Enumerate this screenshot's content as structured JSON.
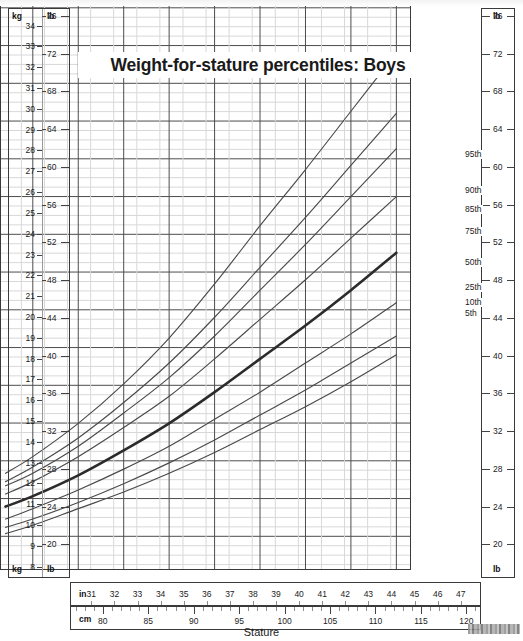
{
  "chart_data": {
    "type": "line",
    "title": "Weight-for-stature percentiles: Boys",
    "xlabel": "Stature",
    "ylabel": "",
    "x_units": [
      "in",
      "cm"
    ],
    "y_units": [
      "kg",
      "lb"
    ],
    "xlim_cm": [
      76.5,
      121.5
    ],
    "ylim_kg": [
      7.5,
      34.8
    ],
    "grid": true,
    "legend_position": "right-inline-curve-labels",
    "x_ticks_cm": [
      80,
      85,
      90,
      95,
      100,
      105,
      110,
      115,
      120
    ],
    "x_ticks_in": [
      31,
      32,
      33,
      34,
      35,
      36,
      37,
      38,
      39,
      40,
      41,
      42,
      43,
      44,
      45,
      46,
      47
    ],
    "y_ticks_kg": [
      8,
      9,
      10,
      11,
      12,
      13,
      14,
      15,
      16,
      17,
      18,
      19,
      20,
      21,
      22,
      23,
      24,
      25,
      26,
      27,
      28,
      29,
      30,
      31,
      32,
      33,
      34
    ],
    "y_ticks_lb": [
      20,
      24,
      28,
      32,
      36,
      40,
      44,
      48,
      52,
      56,
      60,
      64,
      68,
      72,
      76
    ],
    "x_cm": [
      77,
      80,
      85,
      90,
      95,
      100,
      105,
      110,
      115,
      120
    ],
    "series": [
      {
        "name": "95th",
        "label": "95th",
        "values_kg": [
          12.1,
          12.9,
          14.5,
          16.4,
          18.6,
          21.2,
          24.0,
          26.7,
          29.5,
          32.3
        ]
      },
      {
        "name": "90th",
        "label": "90th",
        "values_kg": [
          11.7,
          12.4,
          13.8,
          15.5,
          17.4,
          19.6,
          22.0,
          24.4,
          26.9,
          29.4
        ]
      },
      {
        "name": "85th",
        "label": "85th",
        "values_kg": [
          11.5,
          12.1,
          13.4,
          15.0,
          16.7,
          18.7,
          20.9,
          23.1,
          25.4,
          27.7
        ]
      },
      {
        "name": "75th",
        "label": "75th",
        "values_kg": [
          11.1,
          11.7,
          12.9,
          14.3,
          15.8,
          17.6,
          19.5,
          21.4,
          23.4,
          25.4
        ]
      },
      {
        "name": "50th",
        "label": "50th",
        "values_kg": [
          10.5,
          11.0,
          12.0,
          13.2,
          14.5,
          16.0,
          17.6,
          19.2,
          20.9,
          22.7
        ]
      },
      {
        "name": "25th",
        "label": "25th",
        "values_kg": [
          9.9,
          10.4,
          11.3,
          12.3,
          13.4,
          14.7,
          16.0,
          17.4,
          18.8,
          20.3
        ]
      },
      {
        "name": "10th",
        "label": "10th",
        "values_kg": [
          9.5,
          9.9,
          10.7,
          11.6,
          12.6,
          13.7,
          14.9,
          16.1,
          17.4,
          18.7
        ]
      },
      {
        "name": "5th",
        "label": "5th",
        "values_kg": [
          9.2,
          9.6,
          10.4,
          11.2,
          12.1,
          13.1,
          14.2,
          15.3,
          16.5,
          17.8
        ]
      }
    ],
    "emphasized_series": "50th",
    "curve_color": "#4a4a4a",
    "emphasized_color": "#2b2b2b",
    "grid_major_color": "#4d4d4d",
    "grid_minor_color": "#d8d8d8"
  },
  "axes": {
    "left": {
      "kg_header_top": "kg",
      "kg_header_bottom": "kg",
      "lb_header_top": "lb",
      "lb_header_bottom": "lb"
    },
    "right": {
      "lb_header_top": "lb",
      "lb_header_bottom": "lb"
    },
    "bottom": {
      "in_word": "in",
      "cm_word": "cm",
      "caption": "Stature"
    }
  }
}
